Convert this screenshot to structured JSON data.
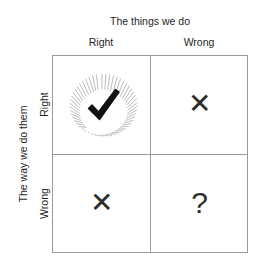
{
  "diagram": {
    "type": "2x2-matrix",
    "column_axis_title": "The things we do",
    "row_axis_title": "The way we do them",
    "column_headers": [
      "Right",
      "Wrong"
    ],
    "row_headers": [
      "Right",
      "Wrong"
    ],
    "cells": {
      "top_left": {
        "icon": "checkmark-sunburst-icon",
        "symbol": "✓"
      },
      "top_right": {
        "icon": "cross-x-icon",
        "symbol": "✕"
      },
      "bottom_left": {
        "icon": "cross-x-icon",
        "symbol": "✕"
      },
      "bottom_right": {
        "icon": "question-mark-icon",
        "symbol": "?"
      }
    },
    "colors": {
      "background": "#ffffff",
      "grid_line": "#9a9a9a",
      "text": "#1f1f1f",
      "glyph": "#2b2b2b",
      "checkmark": "#111111",
      "sunburst_ray": "#b4b4b4"
    }
  }
}
